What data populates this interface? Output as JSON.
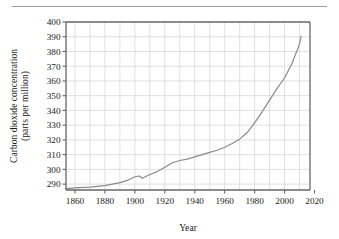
{
  "figure": {
    "name": "co2-concentration-line-chart",
    "has_top_rule": true
  },
  "chart_data": {
    "type": "line",
    "title": "",
    "xlabel": "Year",
    "ylabel": "Carbon dioxide concentration\n(parts per million)",
    "ylabel_line1": "Carbon dioxide concentration",
    "ylabel_line2": "(parts per million)",
    "xlim": [
      1854,
      2017
    ],
    "ylim": [
      286,
      400
    ],
    "xticks": [
      1860,
      1880,
      1900,
      1920,
      1940,
      1960,
      1980,
      2000,
      2020
    ],
    "xtick_labels": [
      "1860",
      "1880",
      "1900",
      "1920",
      "1940",
      "1960",
      "1980",
      "2000",
      "2020"
    ],
    "yticks": [
      290,
      300,
      310,
      320,
      330,
      340,
      350,
      360,
      370,
      380,
      390,
      400
    ],
    "ytick_labels": [
      "290",
      "300",
      "310",
      "320",
      "330",
      "340",
      "350",
      "360",
      "370",
      "380",
      "390",
      "400"
    ],
    "x_minor_gridline_step": 10,
    "grid": true,
    "grid_color": "#d8d8d8",
    "axis_color": "#666666",
    "line_color": "#8a8a8a",
    "line_width": 1.2,
    "legend": null,
    "series": [
      {
        "name": "Atmospheric CO2 concentration",
        "x": [
          1854,
          1860,
          1870,
          1880,
          1890,
          1895,
          1900,
          1903,
          1905,
          1910,
          1915,
          1920,
          1925,
          1930,
          1935,
          1940,
          1945,
          1950,
          1955,
          1960,
          1965,
          1970,
          1975,
          1980,
          1985,
          1990,
          1995,
          2000,
          2005,
          2010,
          2011
        ],
        "y": [
          287.0,
          287.4,
          288.0,
          289.0,
          291.0,
          292.5,
          295.0,
          295.5,
          294.0,
          296.5,
          298.5,
          301.5,
          304.5,
          306.0,
          307.0,
          308.5,
          310.0,
          311.5,
          313.0,
          315.0,
          317.5,
          320.5,
          325.0,
          331.5,
          339.0,
          347.0,
          355.0,
          362.0,
          372.0,
          385.0,
          390.5
        ]
      }
    ]
  }
}
